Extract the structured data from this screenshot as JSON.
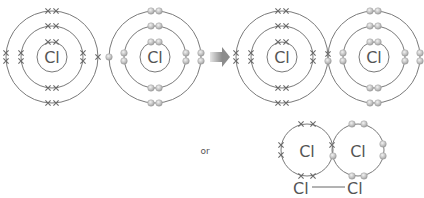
{
  "diagram": {
    "atom_symbol": "Cl",
    "or_label": "or",
    "bond_formula": {
      "left": "Cl",
      "right": "Cl"
    },
    "colors": {
      "ring": "#7a7a7a",
      "cross": "#6a6a6a",
      "dot": "#bdbdbd",
      "arrow": "#9a9a9a",
      "text": "#555555"
    },
    "before": [
      {
        "atom": "Cl",
        "electron_style": "cross",
        "shells": [
          2,
          8,
          7
        ]
      },
      {
        "atom": "Cl",
        "electron_style": "dot",
        "shells": [
          2,
          8,
          7
        ]
      }
    ],
    "after": {
      "shared_pair": 1,
      "description": "Two Cl atoms share one pair of electrons in their outer shells"
    }
  }
}
